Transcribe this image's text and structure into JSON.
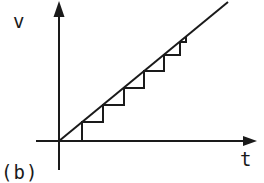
{
  "diagram": {
    "panel_label": "(b)",
    "axes": {
      "y_label": "v",
      "x_label": "t"
    },
    "colors": {
      "ink": "#1a1a1a",
      "background": "#ffffff"
    },
    "geometry": {
      "origin": [
        59,
        141
      ],
      "y_axis": {
        "x": 59,
        "top": 2,
        "bottom": 170
      },
      "x_axis": {
        "y": 141,
        "left": 36,
        "right": 256
      },
      "ramp_line": {
        "from": [
          59,
          141
        ],
        "to": [
          228,
          2
        ]
      },
      "staircase_points": [
        [
          82,
          141
        ],
        [
          82,
          122
        ],
        [
          103,
          122
        ],
        [
          103,
          105
        ],
        [
          124,
          105
        ],
        [
          124,
          88
        ],
        [
          144,
          88
        ],
        [
          144,
          71
        ],
        [
          164,
          71
        ],
        [
          164,
          55
        ],
        [
          180,
          55
        ],
        [
          180,
          42
        ],
        [
          186,
          42
        ],
        [
          186,
          37
        ]
      ]
    }
  }
}
